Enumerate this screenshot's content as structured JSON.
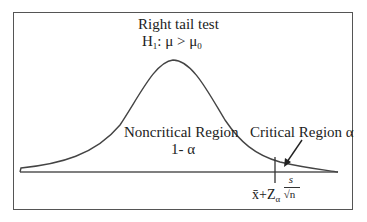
{
  "title": "Right tail test",
  "hypothesis": {
    "h": "H",
    "h_sub": "1",
    "rest": ": μ > μ",
    "mu_sub": "0"
  },
  "noncritical": {
    "line1": "Noncritical Region",
    "line2": "1- α"
  },
  "critical": {
    "label": "Critical Region α"
  },
  "critical_value": {
    "xbar": "x̄",
    "plus": "+Z",
    "alpha_sub": "α",
    "num": "s",
    "den": "√n"
  },
  "colors": {
    "stroke": "#444444",
    "frame": "#555555",
    "text": "#222222"
  }
}
